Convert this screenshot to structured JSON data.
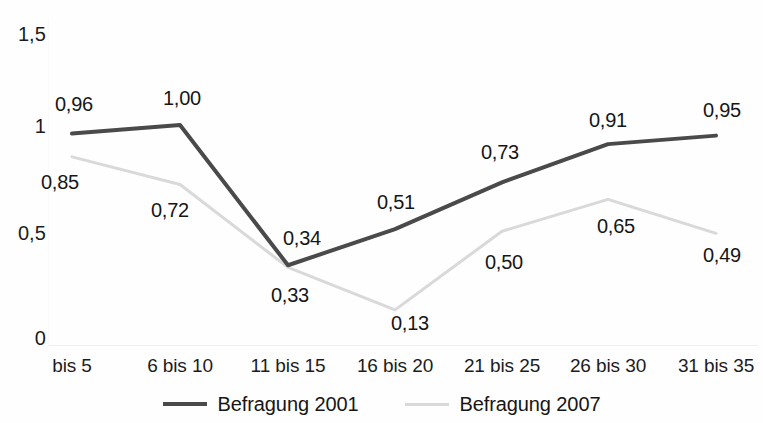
{
  "chart_data": {
    "type": "line",
    "title": "",
    "subtitle": "",
    "xlabel": "",
    "ylabel": "",
    "categories": [
      "bis 5",
      "6 bis 10",
      "11 bis 15",
      "16 bis 20",
      "21 bis 25",
      "26 bis 30",
      "31 bis 35"
    ],
    "ylim": [
      0,
      1.5
    ],
    "yticks": [
      0,
      0.5,
      1,
      1.5
    ],
    "ytick_labels": [
      "0",
      "0,5",
      "1",
      "1,5"
    ],
    "grid": false,
    "legend_position": "bottom",
    "series": [
      {
        "name": "Befragung 2001",
        "color": "#4a4a4a",
        "values": [
          0.96,
          1.0,
          0.34,
          0.51,
          0.73,
          0.91,
          0.95
        ],
        "labels": [
          "0,96",
          "1,00",
          "0,34",
          "0,51",
          "0,73",
          "0,91",
          "0,95"
        ]
      },
      {
        "name": "Befragung 2007",
        "color": "#d9d9d9",
        "values": [
          0.85,
          0.72,
          0.33,
          0.13,
          0.5,
          0.65,
          0.49
        ],
        "labels": [
          "0,85",
          "0,72",
          "0,33",
          "0,13",
          "0,50",
          "0,65",
          "0,49"
        ]
      }
    ]
  },
  "axis": {
    "y_labels": [
      "1,5",
      "1",
      "0,5",
      "0"
    ],
    "x_labels": [
      "bis 5",
      "6 bis 10",
      "11 bis 15",
      "16 bis 20",
      "21 bis 25",
      "26 bis 30",
      "31 bis 35"
    ]
  },
  "series_labels": {
    "s0": [
      "0,96",
      "1,00",
      "0,34",
      "0,51",
      "0,73",
      "0,91",
      "0,95"
    ],
    "s1": [
      "0,85",
      "0,72",
      "0,33",
      "0,13",
      "0,50",
      "0,65",
      "0,49"
    ]
  },
  "legend": {
    "entries": [
      {
        "label": "Befragung 2001"
      },
      {
        "label": "Befragung 2007"
      }
    ]
  }
}
